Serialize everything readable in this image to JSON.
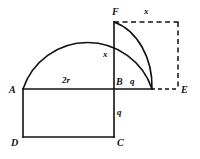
{
  "figure": {
    "kind": "geometry-diagram",
    "background_color": "#ffffff",
    "stroke_color": "#111111",
    "points": {
      "A": {
        "label": "A",
        "x": 23,
        "y": 89,
        "label_x": 9,
        "label_y": 85
      },
      "B": {
        "label": "B",
        "x": 114,
        "y": 89,
        "label_x": 116,
        "label_y": 77
      },
      "C": {
        "label": "C",
        "x": 114,
        "y": 137,
        "label_x": 117,
        "label_y": 138
      },
      "D": {
        "label": "D",
        "x": 23,
        "y": 137,
        "label_x": 11,
        "label_y": 138
      },
      "E": {
        "label": "E",
        "x": 178,
        "y": 89,
        "label_x": 181,
        "label_y": 85
      },
      "F": {
        "label": "F",
        "x": 114,
        "y": 22,
        "label_x": 112,
        "label_y": 7
      }
    },
    "measure_labels": [
      {
        "name": "diameter-label",
        "text": "2r",
        "x": 62,
        "y": 76
      },
      {
        "name": "height-label",
        "text": "x",
        "x": 103,
        "y": 50
      },
      {
        "name": "top-width-label",
        "text": "x",
        "x": 144,
        "y": 7
      },
      {
        "name": "right-segment-label",
        "text": "q",
        "x": 130,
        "y": 77
      },
      {
        "name": "lower-segment-label",
        "text": "q",
        "x": 117,
        "y": 108
      }
    ],
    "solid_segments": [
      {
        "name": "segment-A-E",
        "x1": 23,
        "y1": 89,
        "x2": 152,
        "y2": 89
      },
      {
        "name": "segment-F-C",
        "x1": 114,
        "y1": 22,
        "x2": 114,
        "y2": 137
      },
      {
        "name": "segment-A-D",
        "x1": 23,
        "y1": 89,
        "x2": 23,
        "y2": 137
      },
      {
        "name": "segment-D-C",
        "x1": 23,
        "y1": 137,
        "x2": 114,
        "y2": 137
      }
    ],
    "arcs": [
      {
        "name": "large-semicircle-arc",
        "path": "M 23 89 A 68 68 0 0 1 152 89"
      },
      {
        "name": "small-quarter-arc",
        "path": "M 114 22 A 52 67 0 0 1 152 89"
      }
    ],
    "dashed_segments": [
      {
        "name": "dashed-top-F-to-corner",
        "x1": 114,
        "y1": 22,
        "x2": 178,
        "y2": 22
      },
      {
        "name": "dashed-right-corner-to-E",
        "x1": 178,
        "y1": 22,
        "x2": 178,
        "y2": 89
      },
      {
        "name": "dashed-bottom-arc-to-E",
        "x1": 152,
        "y1": 89,
        "x2": 178,
        "y2": 89
      }
    ]
  }
}
